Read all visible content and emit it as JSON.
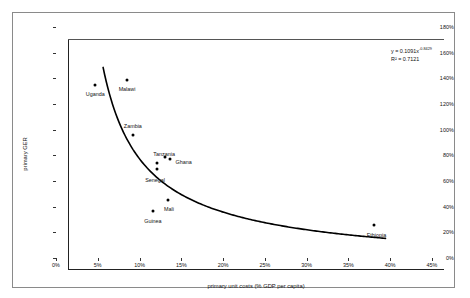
{
  "chart_data": {
    "type": "scatter",
    "title": "",
    "xlabel": "primary unit costs (% GDP per capita)",
    "ylabel": "primary GER",
    "xlim": [
      0,
      45
    ],
    "ylim": [
      0,
      180
    ],
    "xticks": [
      "0%",
      "5%",
      "10%",
      "15%",
      "20%",
      "25%",
      "30%",
      "35%",
      "40%",
      "45%"
    ],
    "xtick_values": [
      0,
      5,
      10,
      15,
      20,
      25,
      30,
      35,
      40,
      45
    ],
    "yticks": [
      "0%",
      "20%",
      "40%",
      "60%",
      "80%",
      "100%",
      "120%",
      "140%",
      "160%",
      "180%"
    ],
    "ytick_values": [
      0,
      20,
      40,
      60,
      80,
      100,
      120,
      140,
      160,
      180
    ],
    "grid": false,
    "legend": "none",
    "points": [
      {
        "label": "Uganda",
        "x": 4.7,
        "y": 135,
        "label_dx": 0,
        "label_dy": 9
      },
      {
        "label": "Malawi",
        "x": 8.5,
        "y": 139,
        "label_dx": 0,
        "label_dy": 9
      },
      {
        "label": "Zambia",
        "x": 9.2,
        "y": 96,
        "label_dx": 0,
        "label_dy": -9
      },
      {
        "label": "Tanzania",
        "x": 12.1,
        "y": 74,
        "label_dx": 7,
        "label_dy": -9
      },
      {
        "label": "Ghana",
        "x": 13.6,
        "y": 77,
        "label_dx": 14,
        "label_dy": 3
      },
      {
        "label": "Senegal",
        "x": 12.1,
        "y": 69,
        "label_dx": -2,
        "label_dy": 11
      },
      {
        "label": "Mali",
        "x": 13.4,
        "y": 45,
        "label_dx": 1,
        "label_dy": 9
      },
      {
        "label": "Guinea",
        "x": 11.6,
        "y": 37,
        "label_dx": 0,
        "label_dy": 10
      },
      {
        "label": "Ethiopia",
        "x": 38.0,
        "y": 26,
        "label_dx": 3,
        "label_dy": 10
      }
    ],
    "trendline": {
      "type": "power",
      "coefficient": 0.1091,
      "exponent": -0.8429,
      "r_squared": 0.7121,
      "x_start": 4.2,
      "x_end": 38.0
    },
    "annotation": {
      "equation_prefix": "y = 0.1091x",
      "equation_exponent": "-0.8429",
      "r_squared_text": "R² = 0.7121"
    }
  }
}
